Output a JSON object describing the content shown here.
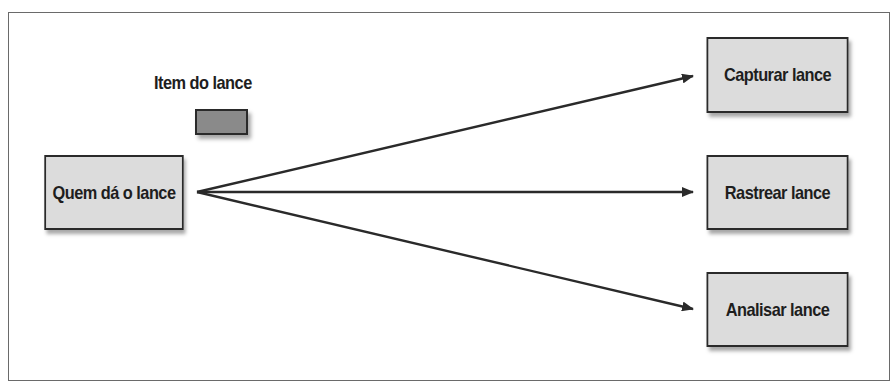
{
  "diagram": {
    "legend": {
      "label": "Item do lance",
      "swatch_color": "#8a8a8a"
    },
    "nodes": [
      {
        "id": "bidder",
        "label": "Quem dá o lance",
        "x": 33,
        "y": 155,
        "w": 162,
        "h": 75
      },
      {
        "id": "capture",
        "label": "Capturar lance",
        "x": 695,
        "y": 37,
        "w": 165,
        "h": 76
      },
      {
        "id": "track",
        "label": "Rastrear lance",
        "x": 695,
        "y": 155,
        "w": 165,
        "h": 75
      },
      {
        "id": "analyze",
        "label": "Analisar lance",
        "x": 695,
        "y": 272,
        "w": 165,
        "h": 75
      }
    ],
    "edges": [
      {
        "from": "bidder",
        "to": "capture",
        "x1": 197,
        "y1": 192,
        "x2": 693,
        "y2": 76
      },
      {
        "from": "bidder",
        "to": "track",
        "x1": 197,
        "y1": 192,
        "x2": 693,
        "y2": 192
      },
      {
        "from": "bidder",
        "to": "analyze",
        "x1": 197,
        "y1": 192,
        "x2": 693,
        "y2": 309
      }
    ],
    "colors": {
      "node_fill": "#dcdcdc",
      "stroke": "#2a2a2a",
      "frame": "#6a6a6a"
    }
  }
}
